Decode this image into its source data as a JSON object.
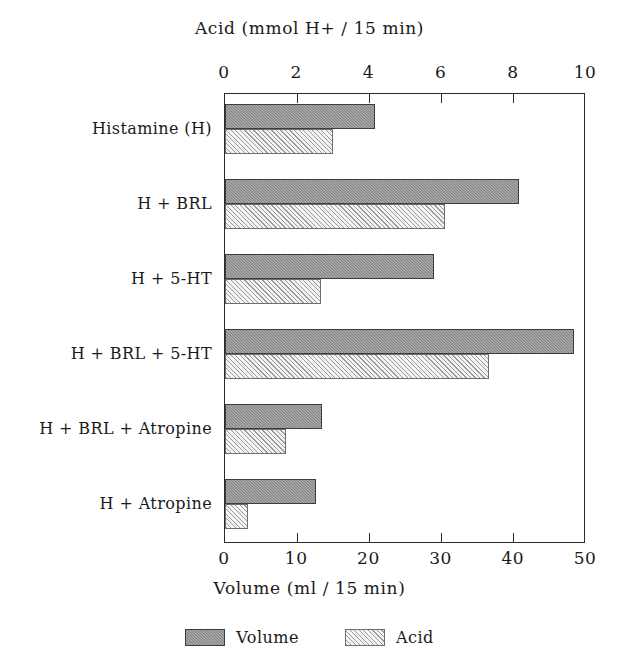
{
  "chart_data": {
    "type": "bar",
    "orientation": "horizontal",
    "title": "",
    "categories": [
      "Histamine (H)",
      "H + BRL",
      "H + 5-HT",
      "H + BRL + 5-HT",
      "H + BRL + Atropine",
      "H + Atropine"
    ],
    "series": [
      {
        "name": "Volume",
        "axis": "bottom",
        "unit": "ml / 15 min",
        "color": "#808080",
        "values": [
          20.8,
          40.7,
          29.0,
          48.3,
          13.4,
          12.6
        ]
      },
      {
        "name": "Acid",
        "axis": "top",
        "unit": "mmol H+ / 15 min",
        "color": "#f2f2f2",
        "values": [
          3.0,
          6.1,
          2.65,
          7.3,
          1.7,
          0.65
        ]
      }
    ],
    "top_axis": {
      "label": "Acid (mmol H+ / 15 min)",
      "ticks": [
        "0",
        "2",
        "4",
        "6",
        "8",
        "10"
      ],
      "values": [
        0,
        2,
        4,
        6,
        8,
        10
      ],
      "range": [
        0,
        10
      ]
    },
    "bottom_axis": {
      "label": "Volume (ml / 15 min)",
      "ticks": [
        "0",
        "10",
        "20",
        "30",
        "40",
        "50"
      ],
      "values": [
        0,
        10,
        20,
        30,
        40,
        50
      ],
      "range": [
        0,
        50
      ]
    },
    "grid": false,
    "legend": {
      "position": "bottom",
      "entries": [
        "Volume",
        "Acid"
      ]
    }
  }
}
